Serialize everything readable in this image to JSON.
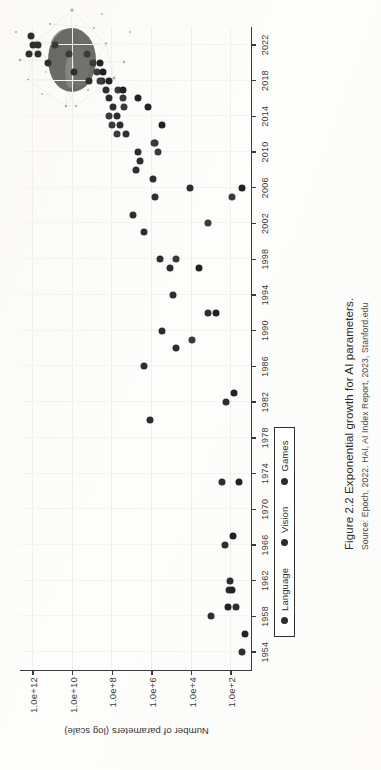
{
  "page": {
    "caption_title": "Figure 2.2  Exponential growth for AI parameters.",
    "caption_source": "Source: Epoch, 2022. HAI, AI Index Report, 2023, Stanford.edu",
    "page_number": "",
    "decorative_graphic": "network-blob-illustration"
  },
  "legend": {
    "items": [
      {
        "label": "Language",
        "color": "#2c2c2c",
        "marker": "circle"
      },
      {
        "label": "Vision",
        "color": "#2c2c2c",
        "marker": "circle"
      },
      {
        "label": "Games",
        "color": "#2c2c2c",
        "marker": "circle"
      }
    ]
  },
  "chart_data": {
    "type": "scatter",
    "title": "Exponential growth for AI parameters.",
    "subtitle": "Source: Epoch, 2022. HAI, AI Index Report, 2023, Stanford.edu",
    "xlabel": "",
    "ylabel": "Number of parameters (log scale)",
    "yscale": "log",
    "xlim": [
      1952,
      2024
    ],
    "ylim": [
      10,
      5000000000000.0
    ],
    "grid": true,
    "legend_position": "bottom-left",
    "xticks": [
      1954,
      1958,
      1962,
      1966,
      1970,
      1974,
      1978,
      1982,
      1986,
      1990,
      1994,
      1998,
      2002,
      2006,
      2010,
      2014,
      2018,
      2022
    ],
    "yticks": [
      "1.0e+2",
      "1.0e+4",
      "1.0e+6",
      "1.0e+8",
      "1.0e+10",
      "1.0e+12"
    ],
    "ytick_values": [
      100,
      10000,
      1000000,
      100000000,
      10000000000,
      1000000000000
    ],
    "series": [
      {
        "name": "Language",
        "color": "#2e2e2e",
        "points": [
          [
            1954,
            30
          ],
          [
            1958,
            1000
          ],
          [
            1959,
            60
          ],
          [
            1961,
            130
          ],
          [
            1962,
            120
          ],
          [
            1966,
            200
          ],
          [
            1973,
            300
          ],
          [
            1980,
            1200000
          ],
          [
            1982,
            180
          ],
          [
            1986,
            2500000
          ],
          [
            1988,
            60000
          ],
          [
            1990,
            300000
          ],
          [
            1992,
            1400
          ],
          [
            1994,
            90000
          ],
          [
            1997,
            120000
          ],
          [
            1998,
            400000
          ],
          [
            2001,
            2500000
          ],
          [
            2003,
            9000000
          ],
          [
            2005,
            700000
          ],
          [
            2006,
            12000
          ],
          [
            2007,
            900000
          ],
          [
            2008,
            6000000
          ],
          [
            2009,
            4000000
          ],
          [
            2010,
            5000000
          ],
          [
            2011,
            700000
          ],
          [
            2012,
            20000000
          ],
          [
            2013,
            40000000
          ],
          [
            2014,
            60000000
          ],
          [
            2015,
            90000000
          ],
          [
            2016,
            150000000
          ],
          [
            2017,
            200000000
          ],
          [
            2018,
            340000000
          ],
          [
            2018,
            1500000000
          ],
          [
            2019,
            8000000000
          ],
          [
            2020,
            175000000000
          ],
          [
            2021,
            530000000000
          ],
          [
            2021,
            1600000000000
          ],
          [
            2022,
            540000000000
          ],
          [
            2022,
            1000000000000
          ],
          [
            2023,
            1200000000000
          ]
        ]
      },
      {
        "name": "Vision",
        "color": "#3a3a3a",
        "points": [
          [
            1989,
            10000
          ],
          [
            1998,
            60000
          ],
          [
            2002,
            1500
          ],
          [
            2005,
            90
          ],
          [
            2010,
            500000
          ],
          [
            2011,
            800000
          ],
          [
            2012,
            60000000
          ],
          [
            2013,
            100000000
          ],
          [
            2014,
            140000000
          ],
          [
            2015,
            25000000
          ],
          [
            2016,
            30000000
          ],
          [
            2017,
            50000000
          ],
          [
            2018,
            400000000
          ],
          [
            2019,
            600000000
          ],
          [
            2020,
            900000000
          ],
          [
            2021,
            1800000000
          ],
          [
            2021,
            15000000000
          ],
          [
            2022,
            80000000000
          ]
        ]
      },
      {
        "name": "Games",
        "color": "#222222",
        "points": [
          [
            1956,
            20
          ],
          [
            1959,
            150
          ],
          [
            1961,
            90
          ],
          [
            1967,
            80
          ],
          [
            1973,
            40
          ],
          [
            1983,
            70
          ],
          [
            1992,
            600
          ],
          [
            1997,
            4000
          ],
          [
            2006,
            30
          ],
          [
            2013,
            300000
          ],
          [
            2015,
            1500000
          ],
          [
            2016,
            5000000
          ],
          [
            2017,
            30000000
          ],
          [
            2018,
            150000000
          ],
          [
            2019,
            300000000
          ],
          [
            2020,
            400000000
          ]
        ]
      }
    ]
  }
}
